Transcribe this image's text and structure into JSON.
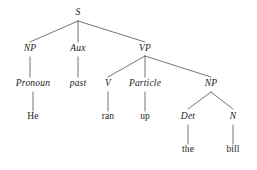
{
  "figure": {
    "kind": "syntax-tree-diagram",
    "sentence": "He past ran up the bill",
    "background_color": "#ffffff",
    "line_color": "#3a3a3a",
    "text_color": "#1a1a1a"
  },
  "nodes": {
    "s": {
      "label": "S",
      "style": "category"
    },
    "np_subject": {
      "label": "NP",
      "style": "category"
    },
    "aux": {
      "label": "Aux",
      "style": "category"
    },
    "vp": {
      "label": "VP",
      "style": "category"
    },
    "pronoun": {
      "label": "Pronoun",
      "style": "category"
    },
    "past": {
      "label": "past",
      "style": "category"
    },
    "v": {
      "label": "V",
      "style": "category"
    },
    "particle": {
      "label": "Particle",
      "style": "category"
    },
    "np_object": {
      "label": "NP",
      "style": "category"
    },
    "det": {
      "label": "Det",
      "style": "category"
    },
    "n": {
      "label": "N",
      "style": "category"
    },
    "he": {
      "label": "He",
      "style": "terminal"
    },
    "ran": {
      "label": "ran",
      "style": "terminal"
    },
    "up": {
      "label": "up",
      "style": "terminal"
    },
    "the": {
      "label": "the",
      "style": "terminal"
    },
    "bill": {
      "label": "bill",
      "style": "terminal"
    }
  }
}
